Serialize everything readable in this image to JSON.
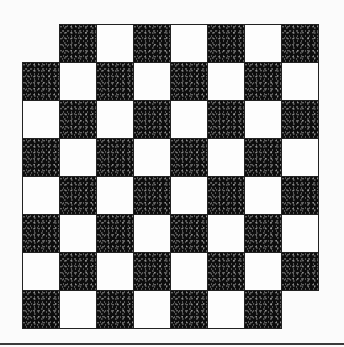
{
  "figure": {
    "rows": 8,
    "cols": 8,
    "removed_cells": [
      [
        0,
        0
      ],
      [
        7,
        7
      ]
    ],
    "dark_rule": "(row+col) odd",
    "colors": {
      "dark": "#0d0d0d",
      "light": "#fdfdfd",
      "border": "#222222",
      "rule": "#3a3a3a"
    },
    "geometry": {
      "col_edges": [
        22,
        59,
        96,
        133,
        170,
        207,
        244,
        281,
        318
      ],
      "row_edges": [
        24,
        62,
        100,
        138,
        176,
        214,
        252,
        290,
        328
      ]
    }
  }
}
